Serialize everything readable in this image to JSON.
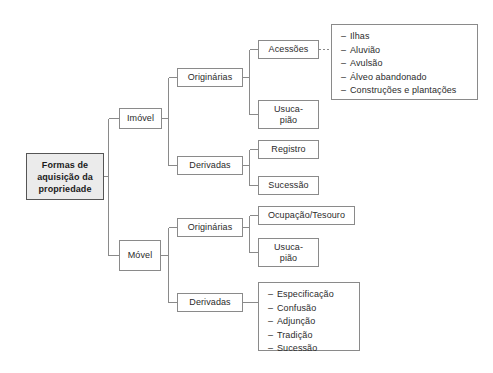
{
  "diagram": {
    "title": "Formas de aquisição da propriedade",
    "root": {
      "line1": "Formas  de",
      "line2": "aquisição  da",
      "line3": "propriedade"
    },
    "branches": {
      "imovel": "Imóvel",
      "movel": "Móvel"
    },
    "categories": {
      "originarias_imovel": "Originárias",
      "derivadas_imovel": "Derivadas",
      "originarias_movel": "Originárias",
      "derivadas_movel": "Derivadas"
    },
    "nodes": {
      "acessoes": "Acessões",
      "usucapiao_imovel_line1": "Usuca-",
      "usucapiao_imovel_line2": "pião",
      "registro": "Registro",
      "sucessao_imovel": "Sucessão",
      "ocupacao_tesouro": "Ocupação/Tesouro",
      "usucapiao_movel_line1": "Usuca-",
      "usucapiao_movel_line2": "pião"
    },
    "acessoes_list": [
      "Ilhas",
      "Aluvião",
      "Avulsão",
      "Álveo abandonado",
      "Construções  e  plantações"
    ],
    "derivadas_movel_list": [
      "Especificação",
      "Confusão",
      "Adjunção",
      "Tradição",
      "Sucessão"
    ],
    "list_dash": "–",
    "colors": {
      "border": "#8a8a8a",
      "root_border": "#555555",
      "root_fill": "#ebebeb",
      "text": "#2b2b2b",
      "connector": "#8a8a8a",
      "background": "#ffffff"
    }
  }
}
